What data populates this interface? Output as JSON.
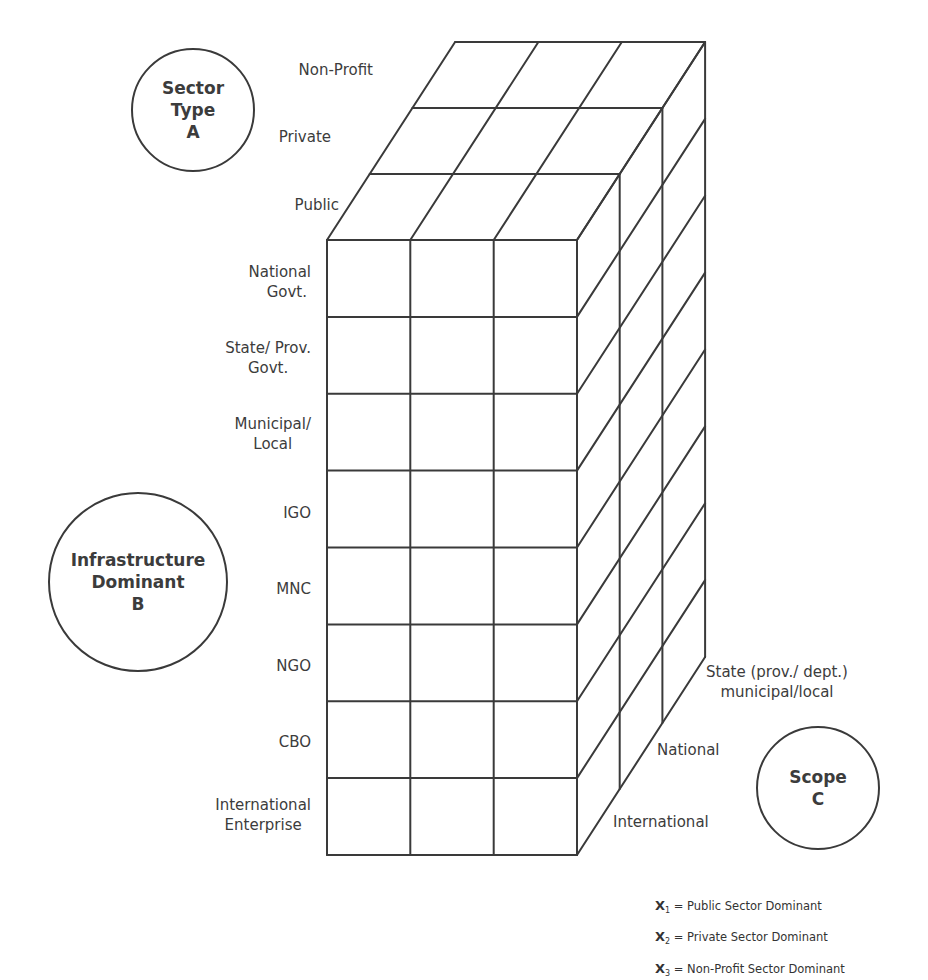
{
  "diagram": {
    "type": "3d-cube-matrix",
    "dimensions": {
      "A": {
        "title_lines": [
          "Sector",
          "Type",
          "A"
        ],
        "levels": [
          "Public",
          "Private",
          "Non-Profit"
        ]
      },
      "B": {
        "title_lines": [
          "Infrastructure",
          "Dominant",
          "B"
        ],
        "levels": [
          [
            "National",
            "Govt."
          ],
          [
            "State/ Prov.",
            "Govt."
          ],
          [
            "Municipal/",
            "Local"
          ],
          [
            "IGO"
          ],
          [
            "MNC"
          ],
          [
            "NGO"
          ],
          [
            "CBO"
          ],
          [
            "International",
            "Enterprise"
          ]
        ]
      },
      "C": {
        "title_lines": [
          "Scope",
          "C"
        ],
        "levels": [
          [
            "International"
          ],
          [
            "National"
          ],
          [
            "State (prov./ dept.)",
            "municipal/local"
          ]
        ]
      }
    },
    "grid": {
      "columns": 3,
      "rows": 8,
      "depth": 3
    },
    "line_color": "#3a3a3a",
    "background": "#ffffff"
  },
  "legend": [
    {
      "symbol": "X",
      "subscript": "1",
      "text": "= Public Sector Dominant"
    },
    {
      "symbol": "X",
      "subscript": "2",
      "text": "= Private Sector Dominant"
    },
    {
      "symbol": "X",
      "subscript": "3",
      "text": "= Non-Profit Sector Dominant"
    }
  ]
}
